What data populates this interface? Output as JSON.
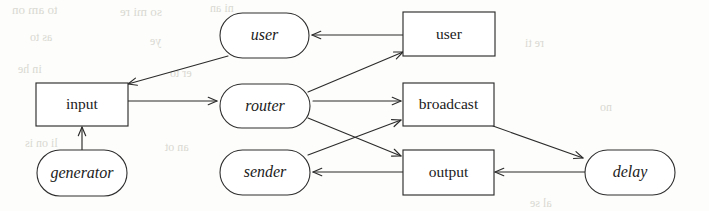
{
  "diagram": {
    "colors": {
      "page_background": "#fdfdfb",
      "stroke": "#2b2b2b",
      "node_fill": "#ffffff",
      "text": "#1b1b1b",
      "ghost": "#d9d9d2"
    },
    "nodes": [
      {
        "id": "user_italic",
        "label": "user",
        "shape": "rounded",
        "style": "italic",
        "x": 220,
        "y": 13,
        "w": 89,
        "h": 45
      },
      {
        "id": "user_rect",
        "label": "user",
        "shape": "rectangle",
        "style": "upright",
        "x": 403,
        "y": 12,
        "w": 92,
        "h": 44
      },
      {
        "id": "input",
        "label": "input",
        "shape": "rectangle",
        "style": "upright",
        "x": 36,
        "y": 83,
        "w": 92,
        "h": 43
      },
      {
        "id": "router",
        "label": "router",
        "shape": "rounded",
        "style": "italic",
        "x": 220,
        "y": 84,
        "w": 90,
        "h": 44
      },
      {
        "id": "broadcast",
        "label": "broadcast",
        "shape": "rectangle",
        "style": "upright",
        "x": 403,
        "y": 83,
        "w": 91,
        "h": 43
      },
      {
        "id": "generator",
        "label": "generator",
        "shape": "rounded",
        "style": "italic",
        "x": 37,
        "y": 150,
        "w": 90,
        "h": 46
      },
      {
        "id": "sender",
        "label": "sender",
        "shape": "rounded",
        "style": "italic",
        "x": 220,
        "y": 150,
        "w": 90,
        "h": 45
      },
      {
        "id": "output",
        "label": "output",
        "shape": "rectangle",
        "style": "upright",
        "x": 403,
        "y": 150,
        "w": 91,
        "h": 45
      },
      {
        "id": "delay",
        "label": "delay",
        "shape": "rounded",
        "style": "italic",
        "x": 585,
        "y": 150,
        "w": 90,
        "h": 45
      }
    ],
    "edges": [
      {
        "id": "edge-user_rect-user_italic",
        "from": "user_rect",
        "to": "user_italic",
        "x1": 403,
        "y1": 35,
        "x2": 312,
        "y2": 35,
        "directed": true
      },
      {
        "id": "edge-user_italic-input",
        "from": "user_italic",
        "to": "input",
        "x1": 228,
        "y1": 56,
        "x2": 128,
        "y2": 84,
        "directed": true
      },
      {
        "id": "edge-generator-input",
        "from": "generator",
        "to": "input",
        "x1": 82,
        "y1": 150,
        "x2": 82,
        "y2": 127,
        "directed": true
      },
      {
        "id": "edge-input-router",
        "from": "input",
        "to": "router",
        "x1": 128,
        "y1": 101,
        "x2": 217,
        "y2": 101,
        "directed": true
      },
      {
        "id": "edge-router-user_rect",
        "from": "router",
        "to": "user_rect",
        "x1": 308,
        "y1": 92,
        "x2": 403,
        "y2": 52,
        "directed": true
      },
      {
        "id": "edge-router-broadcast",
        "from": "router",
        "to": "broadcast",
        "x1": 313,
        "y1": 101,
        "x2": 401,
        "y2": 101,
        "directed": true
      },
      {
        "id": "edge-router-output",
        "from": "router",
        "to": "output",
        "x1": 308,
        "y1": 118,
        "x2": 401,
        "y2": 156,
        "directed": true
      },
      {
        "id": "edge-sender-broadcast",
        "from": "sender",
        "to": "broadcast",
        "x1": 308,
        "y1": 155,
        "x2": 401,
        "y2": 120,
        "directed": true
      },
      {
        "id": "edge-output-sender",
        "from": "output",
        "to": "sender",
        "x1": 403,
        "y1": 172,
        "x2": 313,
        "y2": 172,
        "directed": true
      },
      {
        "id": "edge-broadcast-delay",
        "from": "broadcast",
        "to": "delay",
        "x1": 493,
        "y1": 126,
        "x2": 583,
        "y2": 158,
        "directed": true
      },
      {
        "id": "edge-delay-output",
        "from": "delay",
        "to": "output",
        "x1": 585,
        "y1": 172,
        "x2": 495,
        "y2": 172,
        "directed": true
      }
    ],
    "scan_artifacts": [
      {
        "text": "to  am  on",
        "x": 12,
        "y": 2,
        "size": 13
      },
      {
        "text": "so  mi  re",
        "x": 120,
        "y": 4,
        "size": 13
      },
      {
        "text": "ni  an",
        "x": 210,
        "y": 1,
        "size": 12
      },
      {
        "text": "as  to",
        "x": 30,
        "y": 30,
        "size": 12
      },
      {
        "text": "ye",
        "x": 150,
        "y": 34,
        "size": 12
      },
      {
        "text": "in  he",
        "x": 18,
        "y": 62,
        "size": 12
      },
      {
        "text": "er  to",
        "x": 170,
        "y": 66,
        "size": 12
      },
      {
        "text": "li  on  is",
        "x": 25,
        "y": 136,
        "size": 12
      },
      {
        "text": "an  ot",
        "x": 165,
        "y": 140,
        "size": 12
      },
      {
        "text": "re  ti",
        "x": 525,
        "y": 36,
        "size": 12
      },
      {
        "text": "no",
        "x": 600,
        "y": 100,
        "size": 12
      },
      {
        "text": "al  se",
        "x": 530,
        "y": 196,
        "size": 12
      }
    ]
  }
}
